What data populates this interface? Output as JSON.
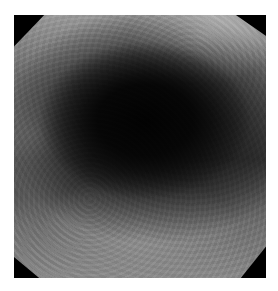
{
  "image": {
    "description": "Grayscale endoscopic view of a lumen with a dark central cavity and octagonal mask",
    "colors": {
      "lumen": "#040404",
      "mucosa_light": "#9a9a9a",
      "mucosa_mid": "#5e5e5e",
      "mask": "#000000",
      "background": "#ffffff"
    }
  }
}
